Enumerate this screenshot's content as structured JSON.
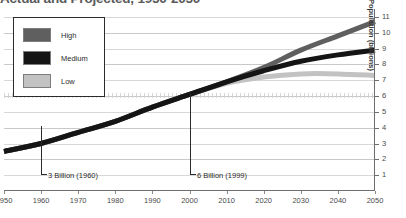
{
  "chart_data": {
    "type": "line",
    "title": "Actual and Projected, 1950-2050",
    "xlabel": "",
    "ylabel": "Population (billions)",
    "xlim": [
      1950,
      2050
    ],
    "ylim": [
      0,
      11.5
    ],
    "grid": true,
    "legend_position": "upper-left-inside",
    "x": [
      1950,
      1960,
      1970,
      1980,
      1990,
      2000,
      2010,
      2020,
      2030,
      2040,
      2050
    ],
    "xticks": [
      "1950",
      "1960",
      "1970",
      "1980",
      "1990",
      "2000",
      "2010",
      "2020",
      "2030",
      "2040",
      "2050"
    ],
    "yticks": [
      "1",
      "2",
      "3",
      "4",
      "5",
      "6",
      "7",
      "8",
      "9",
      "10",
      "11"
    ],
    "ytick_values": [
      1,
      2,
      3,
      4,
      5,
      6,
      7,
      8,
      9,
      10,
      11
    ],
    "series": [
      {
        "name": "High",
        "color": "#5f5f5f",
        "values": [
          2.5,
          3.0,
          3.7,
          4.4,
          5.3,
          6.1,
          6.9,
          7.8,
          8.9,
          9.8,
          10.7
        ]
      },
      {
        "name": "Medium",
        "color": "#151515",
        "values": [
          2.5,
          3.0,
          3.7,
          4.4,
          5.3,
          6.1,
          6.9,
          7.6,
          8.2,
          8.6,
          8.9
        ]
      },
      {
        "name": "Low",
        "color": "#c2c2c2",
        "values": [
          2.5,
          3.0,
          3.7,
          4.4,
          5.3,
          6.1,
          6.8,
          7.2,
          7.4,
          7.4,
          7.3
        ]
      }
    ],
    "annotations": [
      {
        "label": "3 Billion (1960)",
        "x": 1960,
        "y": 3
      },
      {
        "label": "6 Billion (1999)",
        "x": 1999,
        "y": 6
      }
    ]
  },
  "legend": {
    "items": [
      {
        "label": "High",
        "color": "#5f5f5f"
      },
      {
        "label": "Medium",
        "color": "#151515"
      },
      {
        "label": "Low",
        "color": "#c2c2c2"
      }
    ]
  }
}
